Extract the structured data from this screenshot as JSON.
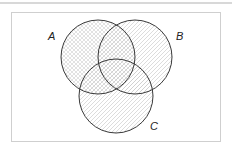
{
  "diagram": {
    "type": "venn",
    "sets": [
      {
        "id": "A",
        "label": "A",
        "cx": 98,
        "cy": 57,
        "r": 37,
        "pattern": "crosshatch",
        "label_x": 48,
        "label_y": 40
      },
      {
        "id": "B",
        "label": "B",
        "cx": 135,
        "cy": 57,
        "r": 37,
        "pattern": "diagonal",
        "label_x": 176,
        "label_y": 40
      },
      {
        "id": "C",
        "label": "C",
        "cx": 116,
        "cy": 96,
        "r": 37,
        "pattern": "diagonal",
        "label_x": 150,
        "label_y": 130
      }
    ],
    "colors": {
      "stroke": "#3a3a3a",
      "hatch": "#c8c8c8",
      "frame": "#cfcfcf",
      "background": "#ffffff"
    }
  }
}
